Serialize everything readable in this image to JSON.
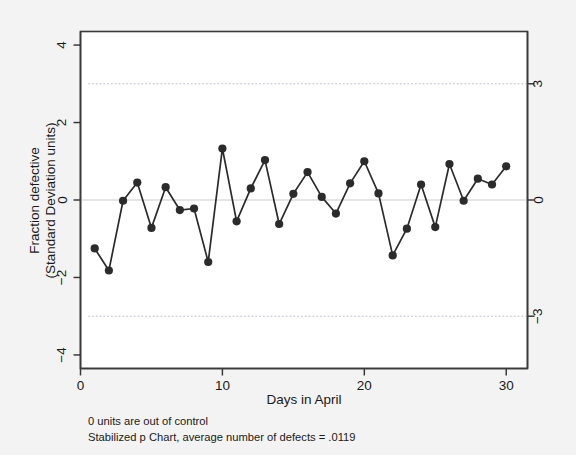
{
  "chart_data": {
    "type": "line",
    "title": "",
    "subtitle": "",
    "xlabel": "Days in April",
    "ylabel": "Fraction defective\n(Standard Deviation units)",
    "ylabel_line1": "Fraction defective",
    "ylabel_line2": "(Standard Deviation units)",
    "xlim": [
      0,
      31.5
    ],
    "ylim": [
      -4.35,
      4.35
    ],
    "xticks": [
      0,
      10,
      20,
      30
    ],
    "xticklabels": [
      "0",
      "10",
      "20",
      "30"
    ],
    "yticks": [
      -4,
      -2,
      0,
      2,
      4
    ],
    "yticklabels": [
      "−4",
      "−2",
      "0",
      "2",
      "4"
    ],
    "y2ticks": [
      -3,
      0,
      3
    ],
    "y2ticklabels": [
      "−3",
      "0",
      "3"
    ],
    "grid": false,
    "legend": null,
    "marker": "filled-circle",
    "line_color": "#2b2b2b",
    "marker_color": "#2b2b2b",
    "control_limit_color": "#b9b9c8",
    "center_line_color": "#dcdcdc",
    "control_limits": [
      3,
      -3
    ],
    "center_line": 0,
    "x": [
      1,
      2,
      3,
      4,
      5,
      6,
      7,
      8,
      9,
      10,
      11,
      12,
      13,
      14,
      15,
      16,
      17,
      18,
      19,
      20,
      21,
      22,
      23,
      24,
      25,
      26,
      27,
      28,
      29,
      30
    ],
    "values": [
      -1.25,
      -1.82,
      -0.02,
      0.45,
      -0.72,
      0.33,
      -0.26,
      -0.22,
      -1.6,
      1.33,
      -0.55,
      0.3,
      1.03,
      -0.62,
      0.16,
      0.72,
      0.08,
      -0.35,
      0.43,
      1.0,
      0.17,
      -1.43,
      -0.74,
      0.4,
      -0.7,
      0.93,
      -0.02,
      0.55,
      0.4,
      0.87
    ],
    "series": [
      {
        "name": "Stabilized p",
        "values": [
          -1.25,
          -1.82,
          -0.02,
          0.45,
          -0.72,
          0.33,
          -0.26,
          -0.22,
          -1.6,
          1.33,
          -0.55,
          0.3,
          1.03,
          -0.62,
          0.16,
          0.72,
          0.08,
          -0.35,
          0.43,
          1.0,
          0.17,
          -1.43,
          -0.74,
          0.4,
          -0.7,
          0.93,
          -0.02,
          0.55,
          0.4,
          0.87
        ]
      }
    ],
    "annotations": [
      "0 units are out of control",
      "Stabilized p Chart, average number of defects = .0119"
    ]
  },
  "footer": {
    "line1": "0 units are out of control",
    "line2": "Stabilized p Chart, average number of defects = .0119"
  },
  "axes": {
    "xlabel": "Days in April",
    "ylabel_line1": "Fraction defective",
    "ylabel_line2": "(Standard Deviation units)"
  }
}
